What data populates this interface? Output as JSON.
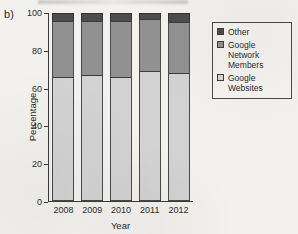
{
  "panel": {
    "label": "b)"
  },
  "chart_data": {
    "type": "bar",
    "subtype": "stacked-bar-100",
    "title": "",
    "xlabel": "Year",
    "ylabel": "Percentage",
    "categories": [
      "2008",
      "2009",
      "2010",
      "2011",
      "2012"
    ],
    "ylim": [
      0,
      100
    ],
    "yticks": [
      0,
      20,
      40,
      60,
      80,
      100
    ],
    "grid": false,
    "legend_position": "right",
    "series": [
      {
        "name": "Google Websites",
        "color": "#d2d2d2",
        "values": [
          66,
          67,
          66,
          69,
          68
        ]
      },
      {
        "name": "Google Network Members",
        "color": "#919191",
        "values": [
          30,
          29,
          30,
          28,
          27
        ]
      },
      {
        "name": "Other",
        "color": "#4d4d4d",
        "values": [
          4,
          4,
          4,
          3,
          5
        ]
      }
    ]
  },
  "legend": {
    "entries": [
      {
        "label": "Other",
        "swatch": "#4d4d4d"
      },
      {
        "label": "Google Network Members",
        "swatch": "#919191"
      },
      {
        "label": "Google Websites",
        "swatch": "#d6d6d6"
      }
    ]
  }
}
